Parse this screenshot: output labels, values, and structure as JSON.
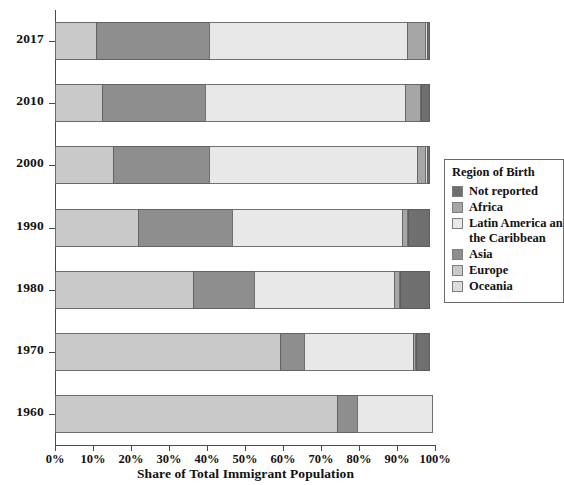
{
  "chart_data": {
    "type": "bar",
    "orientation": "horizontal",
    "stacked": true,
    "normalized_percent": true,
    "title": "",
    "xlabel": "Share of Total Immigrant Population",
    "ylabel": "",
    "xlim": [
      0,
      100
    ],
    "grid": false,
    "legend_position": "right",
    "legend_title": "Region of Birth",
    "categories": [
      "2017",
      "2010",
      "2000",
      "1990",
      "1980",
      "1970",
      "1960"
    ],
    "xticks": [
      "0%",
      "10%",
      "20%",
      "30%",
      "40%",
      "50%",
      "60%",
      "70%",
      "80%",
      "90%",
      "100%"
    ],
    "xtick_values": [
      0,
      10,
      20,
      30,
      40,
      50,
      60,
      70,
      80,
      90,
      100
    ],
    "series": [
      {
        "name": "Europe",
        "color": "#c9c9c9",
        "values": [
          11.0,
          12.5,
          15.5,
          22.0,
          36.5,
          59.5,
          74.5
        ]
      },
      {
        "name": "Asia",
        "color": "#8e8e8e",
        "values": [
          30.0,
          27.5,
          25.5,
          25.0,
          16.5,
          6.5,
          5.5
        ]
      },
      {
        "name": "Latin America and the Caribbean",
        "color": "#e8e8e8",
        "values": [
          52.5,
          53.0,
          55.0,
          45.0,
          37.0,
          29.0,
          20.0
        ]
      },
      {
        "name": "Africa",
        "color": "#a6a6a6",
        "values": [
          5.0,
          4.0,
          2.5,
          1.8,
          1.5,
          0.7,
          0.0
        ]
      },
      {
        "name": "Oceania",
        "color": "#dcdcdc",
        "values": [
          0.6,
          0.6,
          0.6,
          0.5,
          0.5,
          0.4,
          0.0
        ]
      },
      {
        "name": "Not reported",
        "color": "#6f6f6f",
        "values": [
          0.9,
          2.4,
          0.9,
          5.7,
          8.0,
          3.9,
          0.0
        ]
      }
    ]
  },
  "legend": {
    "title": "Region of Birth",
    "items": [
      {
        "label": "Not reported",
        "color": "#6f6f6f"
      },
      {
        "label": "Africa",
        "color": "#a6a6a6"
      },
      {
        "label": "Latin America an",
        "color": "#e8e8e8"
      },
      {
        "label": "Asia",
        "color": "#8e8e8e"
      },
      {
        "label": "Europe",
        "color": "#c9c9c9"
      },
      {
        "label": "Oceania",
        "color": "#dcdcdc"
      }
    ],
    "continuation_line": "the Caribbean"
  },
  "axes": {
    "x_title": "Share of Total Immigrant Population",
    "x_tick_labels": [
      "0%",
      "10%",
      "20%",
      "30%",
      "40%",
      "50%",
      "60%",
      "70%",
      "80%",
      "90%",
      "100%"
    ],
    "y_tick_labels": [
      "2017",
      "2010",
      "2000",
      "1990",
      "1980",
      "1970",
      "1960"
    ]
  },
  "bars": [
    {
      "year": "2017",
      "segments": [
        {
          "region": "Europe",
          "value": 11.0,
          "color": "#c9c9c9"
        },
        {
          "region": "Asia",
          "value": 30.0,
          "color": "#8e8e8e"
        },
        {
          "region": "Latin America and the Caribbean",
          "value": 52.5,
          "color": "#e8e8e8"
        },
        {
          "region": "Africa",
          "value": 5.0,
          "color": "#a6a6a6"
        },
        {
          "region": "Oceania",
          "value": 0.6,
          "color": "#dcdcdc"
        },
        {
          "region": "Not reported",
          "value": 0.9,
          "color": "#6f6f6f"
        }
      ]
    },
    {
      "year": "2010",
      "segments": [
        {
          "region": "Europe",
          "value": 12.5,
          "color": "#c9c9c9"
        },
        {
          "region": "Asia",
          "value": 27.5,
          "color": "#8e8e8e"
        },
        {
          "region": "Latin America and the Caribbean",
          "value": 53.0,
          "color": "#e8e8e8"
        },
        {
          "region": "Africa",
          "value": 4.0,
          "color": "#a6a6a6"
        },
        {
          "region": "Oceania",
          "value": 0.6,
          "color": "#dcdcdc"
        },
        {
          "region": "Not reported",
          "value": 2.4,
          "color": "#6f6f6f"
        }
      ]
    },
    {
      "year": "2000",
      "segments": [
        {
          "region": "Europe",
          "value": 15.5,
          "color": "#c9c9c9"
        },
        {
          "region": "Asia",
          "value": 25.5,
          "color": "#8e8e8e"
        },
        {
          "region": "Latin America and the Caribbean",
          "value": 55.0,
          "color": "#e8e8e8"
        },
        {
          "region": "Africa",
          "value": 2.5,
          "color": "#a6a6a6"
        },
        {
          "region": "Oceania",
          "value": 0.6,
          "color": "#dcdcdc"
        },
        {
          "region": "Not reported",
          "value": 0.9,
          "color": "#6f6f6f"
        }
      ]
    },
    {
      "year": "1990",
      "segments": [
        {
          "region": "Europe",
          "value": 22.0,
          "color": "#c9c9c9"
        },
        {
          "region": "Asia",
          "value": 25.0,
          "color": "#8e8e8e"
        },
        {
          "region": "Latin America and the Caribbean",
          "value": 45.0,
          "color": "#e8e8e8"
        },
        {
          "region": "Africa",
          "value": 1.8,
          "color": "#a6a6a6"
        },
        {
          "region": "Oceania",
          "value": 0.5,
          "color": "#dcdcdc"
        },
        {
          "region": "Not reported",
          "value": 5.7,
          "color": "#6f6f6f"
        }
      ]
    },
    {
      "year": "1980",
      "segments": [
        {
          "region": "Europe",
          "value": 36.5,
          "color": "#c9c9c9"
        },
        {
          "region": "Asia",
          "value": 16.5,
          "color": "#8e8e8e"
        },
        {
          "region": "Latin America and the Caribbean",
          "value": 37.0,
          "color": "#e8e8e8"
        },
        {
          "region": "Africa",
          "value": 1.5,
          "color": "#a6a6a6"
        },
        {
          "region": "Oceania",
          "value": 0.5,
          "color": "#dcdcdc"
        },
        {
          "region": "Not reported",
          "value": 8.0,
          "color": "#6f6f6f"
        }
      ]
    },
    {
      "year": "1970",
      "segments": [
        {
          "region": "Europe",
          "value": 59.5,
          "color": "#c9c9c9"
        },
        {
          "region": "Asia",
          "value": 6.5,
          "color": "#8e8e8e"
        },
        {
          "region": "Latin America and the Caribbean",
          "value": 29.0,
          "color": "#e8e8e8"
        },
        {
          "region": "Africa",
          "value": 0.7,
          "color": "#a6a6a6"
        },
        {
          "region": "Oceania",
          "value": 0.4,
          "color": "#dcdcdc"
        },
        {
          "region": "Not reported",
          "value": 3.9,
          "color": "#6f6f6f"
        }
      ]
    },
    {
      "year": "1960",
      "segments": [
        {
          "region": "Europe",
          "value": 74.5,
          "color": "#c9c9c9"
        },
        {
          "region": "Asia",
          "value": 5.5,
          "color": "#8e8e8e"
        },
        {
          "region": "Latin America and the Caribbean",
          "value": 20.0,
          "color": "#e8e8e8"
        }
      ]
    }
  ]
}
